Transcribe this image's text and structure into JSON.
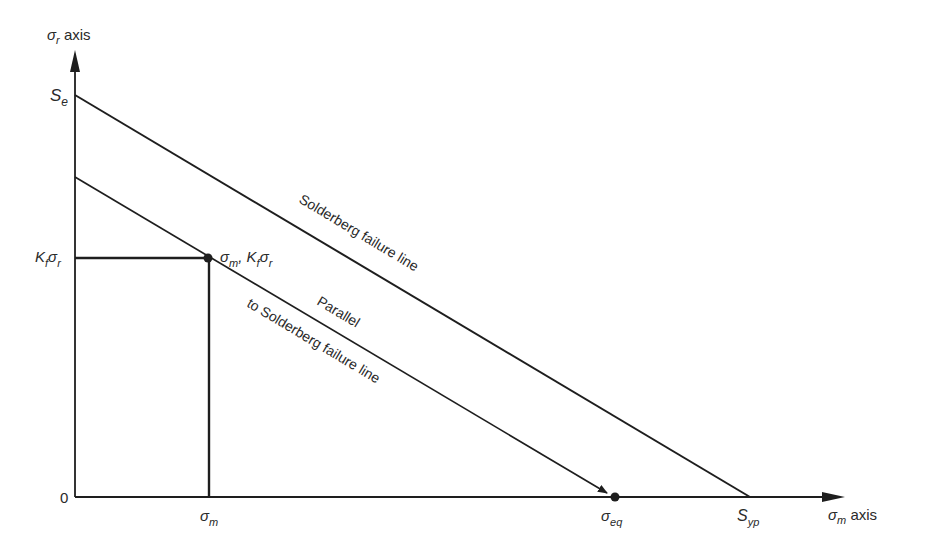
{
  "diagram": {
    "y_axis": {
      "symbol": "σ",
      "sub": "r",
      "suffix": " axis"
    },
    "x_axis": {
      "symbol": "σ",
      "sub": "m",
      "suffix": " axis"
    },
    "labels": {
      "se": {
        "main": "S",
        "sub": "e"
      },
      "kf_sigma_r": {
        "k": "K",
        "ksub": "f",
        "s": "σ",
        "ssub": "r"
      },
      "origin": "0",
      "sigma_m": {
        "main": "σ",
        "sub": "m"
      },
      "sigma_eq": {
        "main": "σ",
        "sub": "eq"
      },
      "syp": {
        "main": "S",
        "sub": "yp"
      },
      "point": {
        "a": "σ",
        "asub": "m",
        "sep": ", ",
        "k": "K",
        "ksub": "f",
        "s": "σ",
        "ssub": "r"
      },
      "solderberg_line": "Solderberg failure line",
      "parallel_line_1": "Parallel",
      "parallel_line_2": "to Solderberg failure line"
    },
    "colors": {
      "line": "#1e1e1e",
      "text": "#2a2a2a",
      "background": "#ffffff"
    }
  }
}
